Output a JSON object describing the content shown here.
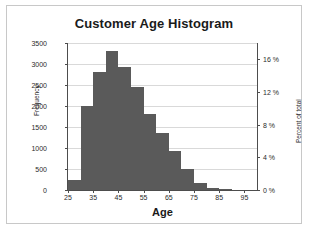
{
  "chart_data": {
    "type": "bar",
    "title": "Customer Age Histogram",
    "xlabel": "Age",
    "ylabel": "Frequency",
    "y2label": "Percent of total",
    "grid": true,
    "legend": "none",
    "xlim": [
      25,
      100
    ],
    "ylim": [
      0,
      3500
    ],
    "y2lim": [
      0,
      18
    ],
    "bin_width": 5,
    "bin_starts": [
      25,
      30,
      35,
      40,
      45,
      50,
      55,
      60,
      65,
      70,
      75,
      80,
      85,
      90,
      95
    ],
    "categories": [
      "25-30",
      "30-35",
      "35-40",
      "40-45",
      "45-50",
      "50-55",
      "55-60",
      "60-65",
      "65-70",
      "70-75",
      "75-80",
      "80-85",
      "85-90",
      "90-95",
      "95-100"
    ],
    "values": [
      250,
      2000,
      2820,
      3300,
      2940,
      2450,
      1820,
      1360,
      930,
      500,
      160,
      40,
      10,
      0,
      0
    ],
    "yticks": [
      0,
      500,
      1000,
      1500,
      2000,
      2500,
      3000,
      3500
    ],
    "ytick_labels": [
      "0",
      "500",
      "1000",
      "1500",
      "2000",
      "2500",
      "3000",
      "3500"
    ],
    "y2ticks": [
      0,
      4,
      8,
      12,
      16
    ],
    "y2tick_labels": [
      "0 %",
      "4 %",
      "8 %",
      "12 %",
      "16 %"
    ],
    "xticks": [
      25,
      35,
      45,
      55,
      65,
      75,
      85,
      95
    ],
    "xtick_labels": [
      "25",
      "35",
      "45",
      "55",
      "65",
      "75",
      "85",
      "95"
    ],
    "bar_color": "#5a5a5a",
    "grid_color": "#d9d9d9",
    "axis_color": "#4d4d4d",
    "border_color": "#c8c8c8",
    "background": "#ffffff"
  }
}
